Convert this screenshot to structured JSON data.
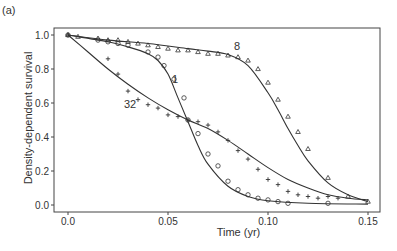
{
  "panel_label": "(a)",
  "chart_data": {
    "type": "line",
    "title": "",
    "panel_label": "(a)",
    "xlabel": "Time (yr)",
    "ylabel": "Density-dependent survival",
    "xlim": [
      -0.005,
      0.155
    ],
    "ylim": [
      -0.02,
      1.02
    ],
    "xticks": [
      "0.0",
      "0.05",
      "0.10",
      "0.15"
    ],
    "yticks": [
      "0.0",
      "0.2",
      "0.4",
      "0.6",
      "0.8",
      "1.0"
    ],
    "grid": false,
    "legend": "inline labels",
    "series": [
      {
        "name": "8",
        "marker": "triangle",
        "label_pos": [
          0.083,
          0.91
        ],
        "fit": {
          "x": [
            0.0,
            0.02,
            0.04,
            0.06,
            0.07,
            0.08,
            0.09,
            0.1,
            0.105,
            0.11,
            0.115,
            0.12,
            0.13,
            0.14,
            0.15
          ],
          "y": [
            1.0,
            0.97,
            0.95,
            0.92,
            0.905,
            0.885,
            0.82,
            0.66,
            0.56,
            0.45,
            0.35,
            0.26,
            0.13,
            0.06,
            0.02
          ]
        },
        "points": {
          "x": [
            0.0,
            0.005,
            0.015,
            0.02,
            0.025,
            0.03,
            0.035,
            0.04,
            0.045,
            0.05,
            0.055,
            0.06,
            0.065,
            0.07,
            0.075,
            0.08,
            0.085,
            0.09,
            0.095,
            0.1,
            0.105,
            0.11,
            0.115,
            0.12,
            0.13,
            0.14,
            0.15
          ],
          "y": [
            1.0,
            0.99,
            0.98,
            0.97,
            0.97,
            0.96,
            0.95,
            0.94,
            0.93,
            0.92,
            0.91,
            0.91,
            0.9,
            0.89,
            0.89,
            0.88,
            0.87,
            0.85,
            0.8,
            0.72,
            0.62,
            0.52,
            0.43,
            0.33,
            0.16,
            0.05,
            0.02
          ]
        }
      },
      {
        "name": "1",
        "marker": "circle",
        "label_pos": [
          0.052,
          0.72
        ],
        "fit": {
          "x": [
            0.0,
            0.02,
            0.03,
            0.04,
            0.045,
            0.05,
            0.055,
            0.06,
            0.065,
            0.07,
            0.08,
            0.09,
            0.1,
            0.12,
            0.15
          ],
          "y": [
            1.0,
            0.96,
            0.93,
            0.89,
            0.85,
            0.77,
            0.63,
            0.49,
            0.35,
            0.24,
            0.11,
            0.05,
            0.025,
            0.01,
            0.005
          ]
        },
        "points": {
          "x": [
            0.0,
            0.015,
            0.02,
            0.025,
            0.03,
            0.04,
            0.045,
            0.048,
            0.053,
            0.058,
            0.06,
            0.065,
            0.07,
            0.075,
            0.08,
            0.085,
            0.09,
            0.095,
            0.1,
            0.105,
            0.11,
            0.13
          ],
          "y": [
            1.0,
            0.97,
            0.96,
            0.95,
            0.94,
            0.9,
            0.87,
            0.82,
            0.74,
            0.63,
            0.5,
            0.42,
            0.3,
            0.23,
            0.14,
            0.09,
            0.06,
            0.04,
            0.03,
            0.02,
            0.01,
            0.01
          ]
        }
      },
      {
        "name": "32",
        "marker": "plus",
        "label_pos": [
          0.028,
          0.57
        ],
        "fit": {
          "x": [
            0.0,
            0.01,
            0.02,
            0.03,
            0.04,
            0.05,
            0.06,
            0.07,
            0.08,
            0.09,
            0.1,
            0.11,
            0.12,
            0.13,
            0.14,
            0.15
          ],
          "y": [
            1.0,
            0.9,
            0.8,
            0.71,
            0.63,
            0.56,
            0.5,
            0.45,
            0.38,
            0.3,
            0.22,
            0.15,
            0.1,
            0.06,
            0.04,
            0.03
          ]
        },
        "points": {
          "x": [
            0.0,
            0.02,
            0.025,
            0.03,
            0.035,
            0.04,
            0.045,
            0.05,
            0.055,
            0.06,
            0.065,
            0.07,
            0.075,
            0.08,
            0.085,
            0.09,
            0.095,
            0.1,
            0.105,
            0.11,
            0.115,
            0.12,
            0.125,
            0.13,
            0.135
          ],
          "y": [
            1.0,
            0.86,
            0.77,
            0.67,
            0.62,
            0.59,
            0.57,
            0.53,
            0.52,
            0.5,
            0.49,
            0.47,
            0.43,
            0.38,
            0.32,
            0.27,
            0.21,
            0.15,
            0.12,
            0.08,
            0.06,
            0.05,
            0.04,
            0.05,
            0.04
          ]
        }
      }
    ]
  }
}
